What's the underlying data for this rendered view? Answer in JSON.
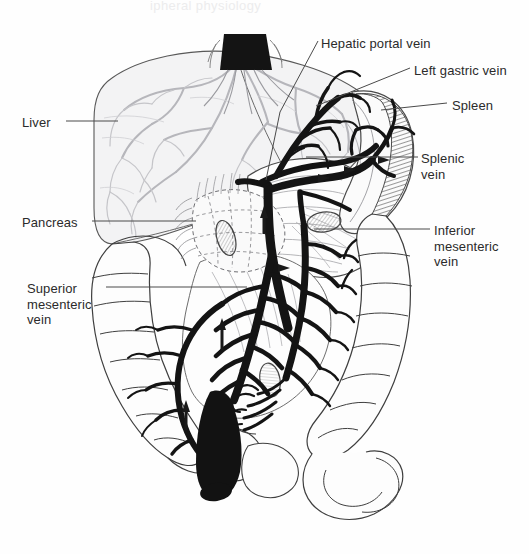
{
  "figure": {
    "title_partial": "ipheral physiology",
    "background": "#fefefe",
    "ink": "#1a1a1a",
    "organ_outline": "#3a3a3a",
    "liver_tone": "#b9b9bd",
    "vein_color": "#161616",
    "leader_color": "#4a4a4a"
  },
  "labels": [
    {
      "id": "liver",
      "text": "Liver",
      "x": 22,
      "y": 115,
      "align": "right-of-text"
    },
    {
      "id": "pancreas",
      "text": "Pancreas",
      "x": 22,
      "y": 215,
      "align": "right-of-text"
    },
    {
      "id": "superior-mesenteric",
      "text": "Superior\nmesenteric\nvein",
      "x": 27,
      "y": 281,
      "align": "right-of-text"
    },
    {
      "id": "hepatic-portal",
      "text": "Hepatic portal vein",
      "x": 321,
      "y": 36,
      "align": "left-of-text"
    },
    {
      "id": "left-gastric",
      "text": "Left gastric vein",
      "x": 414,
      "y": 63,
      "align": "left-of-text"
    },
    {
      "id": "spleen",
      "text": "Spleen",
      "x": 452,
      "y": 98,
      "align": "left-of-text"
    },
    {
      "id": "splenic-vein",
      "text": "Splenic\nvein",
      "x": 421,
      "y": 151,
      "align": "left-of-text"
    },
    {
      "id": "inferior-mesenteric",
      "text": "Inferior\nmesenteric\nvein",
      "x": 434,
      "y": 223,
      "align": "left-of-text"
    }
  ],
  "leaders": [
    {
      "id": "leader-liver",
      "points": "66,121 118,121"
    },
    {
      "id": "leader-pancreas",
      "points": "92,221 196,221"
    },
    {
      "id": "leader-superior-mesenteric",
      "points": "106,287 247,287"
    },
    {
      "id": "leader-hepatic-portal",
      "points": "318,41 278,113 263,178"
    },
    {
      "id": "leader-left-gastric",
      "points": "410,68 315,107"
    },
    {
      "id": "leader-spleen",
      "points": "447,103 381,110"
    },
    {
      "id": "leader-splenic-vein",
      "points": "418,157 305,157"
    },
    {
      "id": "leader-inferior-mesenteric",
      "points": "430,229 315,229"
    }
  ],
  "structures": [
    {
      "id": "inferior-vena-cava-stump",
      "name": "inferior vena cava stump",
      "fill": "black"
    },
    {
      "id": "liver",
      "name": "liver",
      "fill": "light gray"
    },
    {
      "id": "stomach",
      "name": "stomach",
      "fill": "white"
    },
    {
      "id": "spleen",
      "name": "spleen",
      "fill": "hatched"
    },
    {
      "id": "pancreas",
      "name": "pancreas",
      "fill": "white"
    },
    {
      "id": "small-intestine",
      "name": "small intestine",
      "fill": "white"
    },
    {
      "id": "large-intestine",
      "name": "large intestine / colon",
      "fill": "white"
    },
    {
      "id": "rectum",
      "name": "rectum",
      "fill": "black"
    },
    {
      "id": "portal-vein-trunk",
      "name": "hepatic portal vein trunk",
      "fill": "black"
    },
    {
      "id": "splenic-vein-trunk",
      "name": "splenic vein",
      "fill": "black"
    },
    {
      "id": "superior-mesenteric-vein",
      "name": "superior mesenteric vein",
      "fill": "black"
    },
    {
      "id": "inferior-mesenteric-vein",
      "name": "inferior mesenteric vein",
      "fill": "black"
    }
  ]
}
